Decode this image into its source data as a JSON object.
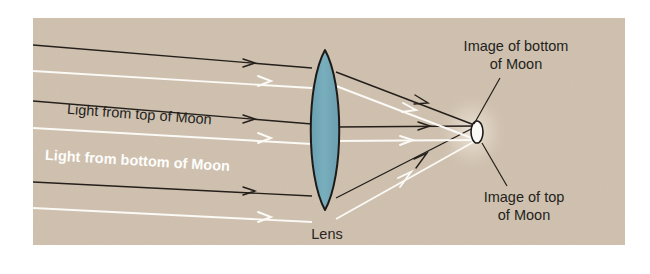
{
  "figure": {
    "panel": {
      "background_color": "#cfc0ae",
      "page_color": "#ffffff",
      "x": 33,
      "y": 18,
      "width": 592,
      "height": 227
    },
    "lens": {
      "label": "Lens",
      "fill_color": "#72a7b8",
      "stroke_color": "#1d1a17",
      "center_x": 325,
      "center_y": 130,
      "half_height": 80,
      "half_width": 14
    },
    "image_point": {
      "x": 477,
      "y": 132,
      "fill_color": "#fbfaf6",
      "stroke_color": "#1d1a17",
      "rx": 6,
      "ry": 11
    },
    "labels": {
      "light_top": "Light from top of Moon",
      "light_bottom": "Light from bottom of Moon",
      "image_bottom_line1": "Image of bottom",
      "image_bottom_line2": "of Moon",
      "image_top_line1": "Image of top",
      "image_top_line2": "of Moon",
      "lens": "Lens"
    },
    "ray_sets": [
      {
        "name": "light-from-top-of-moon",
        "color": "#241f1b",
        "source": "top of Moon",
        "incoming_y_at_left": [
          45,
          101,
          182
        ],
        "incoming_y_at_lens": [
          68,
          124,
          196
        ],
        "converge_x": 477,
        "converge_y": 126
      },
      {
        "name": "light-from-bottom-of-moon",
        "color": "#fbfaf6",
        "source": "bottom of Moon",
        "incoming_y_at_left": [
          71,
          128,
          208
        ],
        "incoming_y_at_lens": [
          88,
          144,
          222
        ],
        "converge_x": 477,
        "converge_y": 140
      }
    ],
    "leader_lines": [
      {
        "name": "leader-image-bottom",
        "from_x": 500,
        "from_y": 78,
        "to_x": 474,
        "to_y": 124
      },
      {
        "name": "leader-image-top",
        "from_x": 507,
        "from_y": 186,
        "to_x": 482,
        "to_y": 143
      }
    ]
  }
}
